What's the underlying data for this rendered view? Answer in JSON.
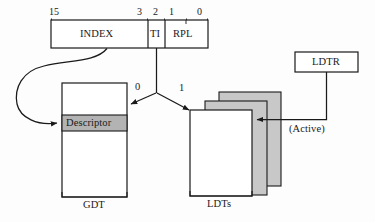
{
  "diagram": {
    "colors": {
      "stroke": "#1a1a1a",
      "descriptor_fill": "#b3b3b3",
      "ldt_shadow_fill": "#c8c8c8",
      "box_fill": "#ffffff",
      "background": "#fdfdfd"
    },
    "selector": {
      "name": "segment-selector",
      "bit_labels": [
        {
          "text": "15",
          "x": 50,
          "y": 10
        },
        {
          "text": "3",
          "x": 138,
          "y": 10
        },
        {
          "text": "2",
          "x": 153,
          "y": 10
        },
        {
          "text": "1",
          "x": 169,
          "y": 10
        },
        {
          "text": "0",
          "x": 198,
          "y": 10
        }
      ],
      "fields": [
        {
          "name": "index",
          "label": "INDEX",
          "x": 51,
          "y": 20,
          "w": 97,
          "h": 28
        },
        {
          "name": "ti",
          "label": "TI",
          "x": 148,
          "y": 20,
          "w": 17,
          "h": 28
        },
        {
          "name": "rpl",
          "label": "RPL",
          "x": 165,
          "y": 20,
          "w": 43,
          "h": 28
        }
      ]
    },
    "branch": {
      "ti_zero_label": "0",
      "ti_one_label": "1"
    },
    "gdt": {
      "name": "gdt-table",
      "caption": "GDT",
      "descriptor_label": "Descriptor"
    },
    "ldts": {
      "name": "ldt-tables",
      "caption": "LDTs",
      "count": 3
    },
    "ldtr": {
      "name": "ldtr-register",
      "label": "LDTR",
      "active_label": "(Active)"
    }
  }
}
